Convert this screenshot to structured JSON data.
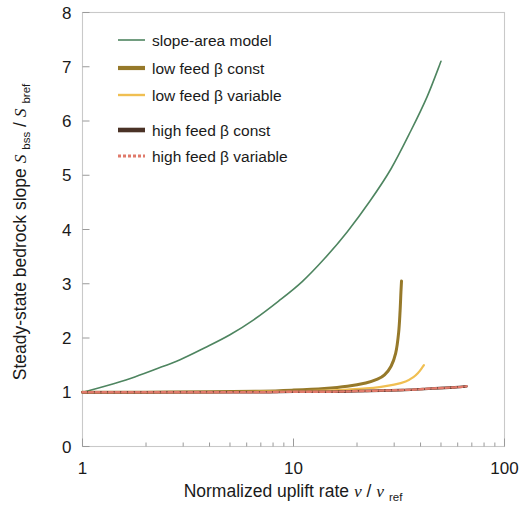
{
  "chart_data": {
    "type": "line",
    "title": "",
    "xlabel": "Normalized uplift rate  v / v_ref",
    "ylabel": "Steady-state bedrock slope  S_bss / S_bref",
    "xscale": "log",
    "yscale": "linear",
    "xlim": [
      1,
      100
    ],
    "ylim": [
      0,
      8
    ],
    "xticks": [
      1,
      10,
      100
    ],
    "xtick_labels": [
      "1",
      "10",
      "100"
    ],
    "yticks": [
      0,
      1,
      2,
      3,
      4,
      5,
      6,
      7,
      8
    ],
    "ytick_labels": [
      "0",
      "1",
      "2",
      "3",
      "4",
      "5",
      "6",
      "7",
      "8"
    ],
    "grid": false,
    "legend_position": "upper-left-inside",
    "series": [
      {
        "name": "slope-area model",
        "color": "#4e8560",
        "style": "solid",
        "width": 1.6,
        "x": [
          1,
          1.3,
          1.7,
          2.2,
          2.9,
          3.8,
          5,
          6.5,
          8.5,
          11,
          14,
          18,
          23,
          29,
          36,
          43,
          50
        ],
        "y": [
          1.0,
          1.12,
          1.26,
          1.42,
          1.6,
          1.82,
          2.06,
          2.34,
          2.68,
          3.04,
          3.46,
          3.96,
          4.52,
          5.12,
          5.82,
          6.45,
          7.1
        ]
      },
      {
        "name": "low feed β const",
        "color": "#96792a",
        "style": "solid",
        "width": 3.0,
        "x": [
          1,
          2,
          4,
          7,
          10,
          14,
          18,
          22,
          25,
          27,
          29,
          30.5,
          31.5,
          32,
          32.3,
          32.5
        ],
        "y": [
          1.0,
          1.0,
          1.01,
          1.02,
          1.04,
          1.07,
          1.11,
          1.17,
          1.24,
          1.32,
          1.48,
          1.72,
          2.1,
          2.5,
          2.85,
          3.05
        ]
      },
      {
        "name": "low feed β variable",
        "color": "#f0bf52",
        "style": "solid",
        "width": 2.2,
        "x": [
          1,
          2,
          4,
          7,
          10,
          14,
          18,
          22,
          26,
          30,
          34,
          37,
          39,
          40.5,
          41.5
        ],
        "y": [
          1.0,
          1.0,
          1.0,
          1.01,
          1.02,
          1.03,
          1.05,
          1.07,
          1.1,
          1.14,
          1.2,
          1.28,
          1.36,
          1.44,
          1.5
        ]
      },
      {
        "name": "high feed β const",
        "color": "#4a3226",
        "style": "solid",
        "width": 2.6,
        "x": [
          1,
          2,
          4,
          7,
          10,
          15,
          20,
          26,
          32,
          38,
          45,
          52,
          58,
          63,
          66
        ],
        "y": [
          1.0,
          1.0,
          1.0,
          1.0,
          1.01,
          1.01,
          1.02,
          1.03,
          1.04,
          1.05,
          1.07,
          1.08,
          1.09,
          1.1,
          1.11
        ]
      },
      {
        "name": "high feed β variable",
        "color": "#e07a6b",
        "style": "dashed",
        "width": 2.4,
        "x": [
          1,
          2,
          4,
          7,
          10,
          15,
          20,
          26,
          32,
          38,
          45,
          52,
          58,
          63,
          66
        ],
        "y": [
          1.0,
          1.0,
          1.0,
          1.0,
          1.01,
          1.01,
          1.02,
          1.03,
          1.04,
          1.05,
          1.07,
          1.08,
          1.09,
          1.1,
          1.11
        ]
      }
    ]
  },
  "axes": {
    "y_title_main": "Steady-state bedrock slope",
    "y_title_sym_s1": "S",
    "y_title_sub1": "bss",
    "y_title_slash": "/",
    "y_title_sym_s2": "S",
    "y_title_sub2": "bref",
    "x_title_main": "Normalized uplift rate",
    "x_title_sym_v1": "v",
    "x_title_slash": "/",
    "x_title_sym_v2": "v",
    "x_title_sub": "ref"
  },
  "legend": {
    "items": [
      {
        "label": "slope-area model",
        "color": "#4e8560",
        "style": "solid",
        "width": 1.6
      },
      {
        "label": "low feed β const",
        "color": "#96792a",
        "style": "solid",
        "width": 4.2
      },
      {
        "label": "low feed β variable",
        "color": "#f0bf52",
        "style": "solid",
        "width": 2.4
      },
      {
        "label": "high feed β const",
        "color": "#4a3226",
        "style": "solid",
        "width": 4.6
      },
      {
        "label": "high feed β variable",
        "color": "#e07a6b",
        "style": "dashed",
        "width": 3.0
      }
    ]
  }
}
